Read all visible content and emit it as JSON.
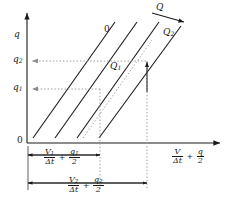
{
  "figure": {
    "type": "line-diagram",
    "axes": {
      "y_axis_label": "q",
      "x_axis_label_parts": {
        "num1": "V",
        "den1": "Δt",
        "op": "+",
        "num2": "q",
        "den2": "2"
      },
      "origin_label": "0"
    },
    "y_ticks": [
      {
        "id": "q2",
        "base": "q",
        "sub": "2",
        "y_px": 61
      },
      {
        "id": "q1",
        "base": "q",
        "sub": "1",
        "y_px": 89
      }
    ],
    "lines": [
      {
        "id": "line-0",
        "label": "0",
        "sub": "",
        "style": "solid",
        "x_at_axis": 33
      },
      {
        "id": "line-q1",
        "label": "Q",
        "sub": "1",
        "style": "solid",
        "x_at_axis": 55
      },
      {
        "id": "line-mid",
        "label": "",
        "sub": "",
        "style": "solid",
        "x_at_axis": 77
      },
      {
        "id": "line-q2",
        "label": "Q",
        "sub": "2",
        "style": "solid",
        "x_at_axis": 99
      }
    ],
    "dotted_line": {
      "id": "dotted-diagonal",
      "style": "dotted"
    },
    "direction_arrow": {
      "label": "Q",
      "meaning": "increasing Q",
      "direction": "down-right"
    },
    "dimension_1": {
      "num1": "V",
      "sub1": "1",
      "den1": "Δt",
      "op": "+",
      "num2": "q",
      "sub2": "1",
      "den2": "2",
      "x_start_px": 28,
      "x_end_px": 100
    },
    "dimension_2": {
      "num1": "V",
      "sub1": "2",
      "den1": "Δt",
      "op": "+",
      "num2": "q",
      "sub2": "2",
      "den2": "2",
      "x_start_px": 28,
      "x_end_px": 147
    },
    "colors": {
      "stroke": "#1a1a1a",
      "guide": "#9a9a9a",
      "background": "#ffffff"
    }
  }
}
